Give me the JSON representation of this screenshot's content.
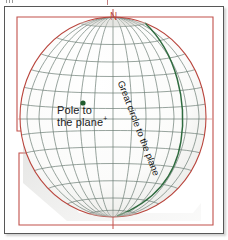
{
  "figure": {
    "type": "sphere-graticule-diagram",
    "frame": {
      "outer_border_color": "#575757",
      "inner_rect_color": "#c2514b"
    },
    "colors": {
      "graticule": "#6b7d74",
      "sphere_outline": "#b9453d",
      "great_circle": "#2f6b3f",
      "pole_point": "#1f5c2e",
      "north_label": "#b94a43",
      "text": "#1b1b1b",
      "sphere_fill": "#f4f4f2",
      "shadow": "#b8b8b4"
    },
    "labels": {
      "north": "N",
      "pole_line1": "Pole to",
      "pole_line2": "the plane",
      "pole_superscript": "+",
      "great_circle": "Great circle to the plane"
    },
    "geometry": {
      "sphere_center_x": 108,
      "sphere_center_y": 110,
      "sphere_radius_x": 93,
      "sphere_radius_y": 100,
      "meridian_count": 18,
      "parallel_count": 12,
      "pole_point_x": 78,
      "pole_point_y": 96,
      "pole_point_radius": 2.6
    },
    "annotations": {
      "north_tick": "vertical red tick at north pole",
      "south_tick": "vertical red tick at south pole",
      "equator_line": "faint horizontal red line at equator",
      "corner_notch": "stepped rectangular notch at lower-left of red boundary"
    }
  }
}
